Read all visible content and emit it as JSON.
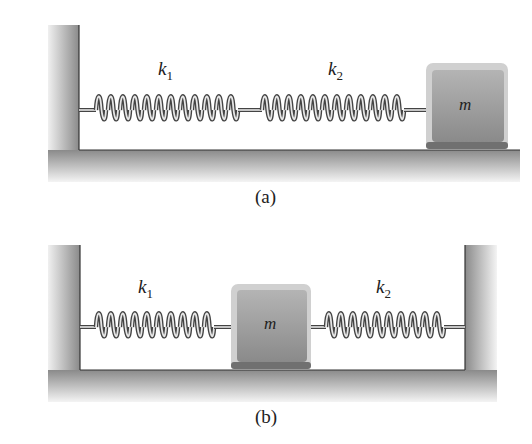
{
  "figure_a": {
    "caption": "(a)",
    "spring1": {
      "symbol": "k",
      "subscript": "1"
    },
    "spring2": {
      "symbol": "k",
      "subscript": "2"
    },
    "mass": "m",
    "description": "Two springs in series between a wall and a mass on a floor"
  },
  "figure_b": {
    "caption": "(b)",
    "spring1": {
      "symbol": "k",
      "subscript": "1"
    },
    "spring2": {
      "symbol": "k",
      "subscript": "2"
    },
    "mass": "m",
    "description": "Mass between two springs attached to opposite walls"
  },
  "colors": {
    "wall_dark": "#8a8a8a",
    "wall_light": "#f2f2f2",
    "mass_fill": "#9c9c9c",
    "spring_dark": "#4a4a4a",
    "spring_light": "#e8e8e8"
  }
}
